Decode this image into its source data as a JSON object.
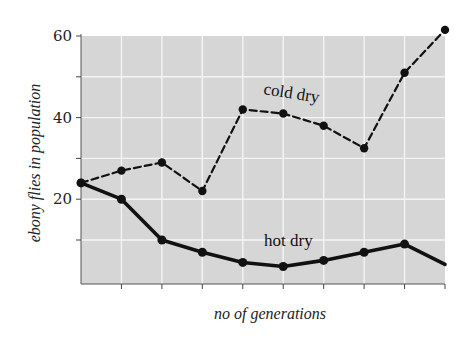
{
  "chart_data": {
    "type": "line",
    "title": "",
    "xlabel": "no of generations",
    "ylabel": "ebony flies in population",
    "x": [
      0,
      1,
      2,
      3,
      4,
      5,
      6,
      7,
      8,
      9
    ],
    "x_tick_labels": [],
    "ylim": [
      0,
      60
    ],
    "y_ticks": [
      10,
      20,
      30,
      40,
      50,
      60
    ],
    "y_tick_labels": [
      "",
      "20",
      "",
      "40",
      "",
      "60"
    ],
    "grid": true,
    "legend": "inline labels",
    "series": [
      {
        "name": "cold dry",
        "style": "dashed",
        "values": [
          24,
          27,
          29,
          22,
          42,
          41,
          38,
          32.5,
          51,
          61.5
        ]
      },
      {
        "name": "hot dry",
        "style": "solid",
        "values": [
          24,
          20,
          10,
          7,
          4.5,
          3.5,
          5,
          7,
          9,
          4
        ]
      }
    ],
    "colors": {
      "plot_background": "#d6d6d6",
      "grid": "#f4f4f4",
      "line": "#111111"
    }
  }
}
